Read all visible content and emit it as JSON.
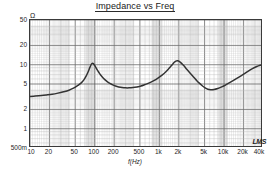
{
  "chart_data": {
    "type": "line",
    "title": "Impedance vs Freq",
    "xlabel": "f(Hz)",
    "ylabel": "Ω",
    "xscale": "log",
    "yscale": "log",
    "xlim": [
      10,
      40000
    ],
    "ylim": [
      0.5,
      50
    ],
    "grid": true,
    "legend": null,
    "xticks": [
      10,
      20,
      50,
      100,
      200,
      500,
      1000,
      2000,
      5000,
      10000,
      20000,
      40000
    ],
    "xticklabels": [
      "10",
      "20",
      "50",
      "100",
      "200",
      "500",
      "1k",
      "2k",
      "5k",
      "10k",
      "20k",
      "40k"
    ],
    "yticks": [
      0.5,
      1,
      2,
      5,
      10,
      20,
      50
    ],
    "yticklabels": [
      "500m",
      "1",
      "2",
      "5",
      "10",
      "20",
      "50"
    ],
    "series": [
      {
        "name": "Impedance",
        "color": "#333333",
        "x": [
          10,
          12,
          15,
          18,
          22,
          27,
          33,
          40,
          47,
          55,
          62,
          68,
          74,
          79,
          84,
          88,
          91,
          94,
          97,
          101,
          106,
          112,
          120,
          130,
          142,
          156,
          172,
          190,
          210,
          235,
          265,
          300,
          340,
          390,
          450,
          520,
          600,
          700,
          820,
          950,
          1100,
          1250,
          1400,
          1550,
          1700,
          1800,
          1900,
          2050,
          2200,
          2400,
          2650,
          2950,
          3300,
          3700,
          4100,
          4600,
          5100,
          5600,
          6200,
          7000,
          8000,
          9200,
          10500,
          12000,
          14000,
          16500,
          19500,
          23000,
          27000,
          32000,
          36000,
          40000
        ],
        "y": [
          3.2,
          3.24,
          3.3,
          3.37,
          3.46,
          3.6,
          3.78,
          4.0,
          4.3,
          4.75,
          5.2,
          5.8,
          6.7,
          7.7,
          9.0,
          10.0,
          10.45,
          10.5,
          10.2,
          9.6,
          8.8,
          8.0,
          7.2,
          6.5,
          5.9,
          5.45,
          5.1,
          4.85,
          4.65,
          4.5,
          4.4,
          4.35,
          4.35,
          4.4,
          4.5,
          4.65,
          4.9,
          5.2,
          5.65,
          6.2,
          6.9,
          7.7,
          8.7,
          9.8,
          10.9,
          11.4,
          11.5,
          11.2,
          10.5,
          9.6,
          8.5,
          7.5,
          6.6,
          5.8,
          5.2,
          4.7,
          4.35,
          4.15,
          4.08,
          4.1,
          4.25,
          4.5,
          4.8,
          5.2,
          5.7,
          6.3,
          7.0,
          7.8,
          8.6,
          9.4,
          9.8,
          10.2
        ]
      }
    ],
    "annotations": [
      {
        "name": "resonance-peak-1",
        "x": 94,
        "y": 10.5
      },
      {
        "name": "resonance-peak-2",
        "x": 1900,
        "y": 11.5
      },
      {
        "name": "minimum-1",
        "x": 320,
        "y": 4.35
      },
      {
        "name": "minimum-2",
        "x": 6200,
        "y": 4.08
      }
    ],
    "shaded_bands": [
      {
        "from": 72,
        "to": 105
      },
      {
        "from": 760,
        "to": 1100
      },
      {
        "from": 8200,
        "to": 11500
      }
    ]
  },
  "watermark": {
    "label": "LMS"
  },
  "colors": {
    "curve": "#333333",
    "major_grid": "#555555",
    "minor_grid": "#b9b9b9",
    "band": "#cccccc",
    "frame": "#3a3a3a",
    "text": "#262626"
  }
}
